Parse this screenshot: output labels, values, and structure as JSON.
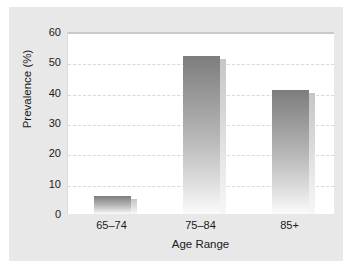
{
  "chart_data": {
    "type": "bar",
    "title": "",
    "subtitle": "",
    "xlabel": "Age Range",
    "ylabel": "Prevalence (%)",
    "categories": [
      "65–74",
      "75–84",
      "85+"
    ],
    "values": [
      6,
      52,
      41
    ],
    "series": [
      {
        "name": "Prevalence",
        "values": [
          6,
          52,
          41
        ]
      }
    ],
    "ylim": [
      0,
      60
    ],
    "yticks": [
      0,
      10,
      20,
      30,
      40,
      50,
      60
    ],
    "ytick_labels": [
      "0",
      "10",
      "20",
      "30",
      "40",
      "50",
      "60"
    ],
    "grid": "horizontal-dashed",
    "legend": "none",
    "annotations": [],
    "colors": {
      "bar_top": "#7d7d7d",
      "bar_bottom": "#fbfbfb",
      "bar_shadow": "#c6c6c6",
      "gridline": "#d8d8d8",
      "plot_background": "#ffffff",
      "figure_background": "#e8e8e8",
      "text": "#1a1a1a"
    }
  }
}
